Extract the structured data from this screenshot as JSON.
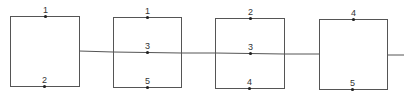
{
  "diagram": {
    "type": "block-connection-diagram",
    "stroke_color": "#555555",
    "node_color": "#222222",
    "boxes": [
      {
        "id": "box-1",
        "x": 10,
        "y": 16,
        "w": 69,
        "h": 70,
        "nodes": [
          {
            "label": "1",
            "x": 45,
            "y": 16,
            "position": "top"
          },
          {
            "label": "2",
            "x": 44,
            "y": 86,
            "position": "bottom"
          }
        ]
      },
      {
        "id": "box-2",
        "x": 113,
        "y": 17,
        "w": 68,
        "h": 70,
        "nodes": [
          {
            "label": "1",
            "x": 147,
            "y": 17,
            "position": "top"
          },
          {
            "label": "3",
            "x": 147,
            "y": 52,
            "position": "middle"
          },
          {
            "label": "5",
            "x": 147,
            "y": 87,
            "position": "bottom"
          }
        ]
      },
      {
        "id": "box-3",
        "x": 215,
        "y": 18,
        "w": 69,
        "h": 70,
        "nodes": [
          {
            "label": "2",
            "x": 250,
            "y": 18,
            "position": "top"
          },
          {
            "label": "3",
            "x": 250,
            "y": 53,
            "position": "middle"
          },
          {
            "label": "4",
            "x": 249,
            "y": 88,
            "position": "bottom"
          }
        ]
      },
      {
        "id": "box-4",
        "x": 319,
        "y": 19,
        "w": 68,
        "h": 70,
        "nodes": [
          {
            "label": "4",
            "x": 353,
            "y": 19,
            "position": "top"
          },
          {
            "label": "5",
            "x": 352,
            "y": 89,
            "position": "bottom"
          }
        ]
      }
    ],
    "wires": [
      {
        "x1": 79,
        "y1": 51,
        "x2": 113,
        "y2": 52
      },
      {
        "x1": 113,
        "y1": 52,
        "x2": 181,
        "y2": 53
      },
      {
        "x1": 181,
        "y1": 53,
        "x2": 215,
        "y2": 53
      },
      {
        "x1": 215,
        "y1": 53,
        "x2": 284,
        "y2": 54
      },
      {
        "x1": 284,
        "y1": 54,
        "x2": 319,
        "y2": 54
      },
      {
        "x1": 387,
        "y1": 55,
        "x2": 404,
        "y2": 55
      }
    ]
  }
}
